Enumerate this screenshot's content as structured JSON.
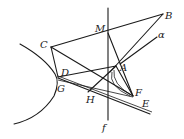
{
  "diagram": {
    "type": "geometry",
    "points": {
      "A": {
        "label": "A",
        "x": 116,
        "y": 66
      },
      "B": {
        "label": "B",
        "x": 163,
        "y": 14
      },
      "C": {
        "label": "C",
        "x": 51,
        "y": 47
      },
      "D": {
        "label": "D",
        "x": 58,
        "y": 76
      },
      "E": {
        "label": "E",
        "x": 152,
        "y": 113
      },
      "F": {
        "label": "F",
        "x": 133,
        "y": 96
      },
      "G": {
        "label": "G",
        "x": 58,
        "y": 79
      },
      "H": {
        "label": "H",
        "x": 90,
        "y": 96
      },
      "M": {
        "label": "M",
        "x": 108,
        "y": 33
      }
    },
    "lines": {
      "f": {
        "label": "f"
      },
      "alpha": {
        "label": "α"
      }
    }
  }
}
